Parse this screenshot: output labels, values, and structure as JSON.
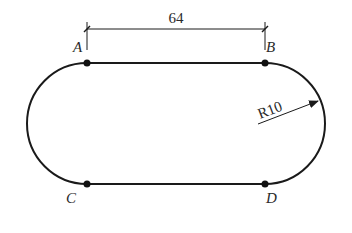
{
  "diagram": {
    "type": "technical-drawing",
    "shape": "stadium (obround) track",
    "stroke_color": "#1a1a1a",
    "background": "#ffffff",
    "dimension": {
      "label": "64",
      "from_point": "A",
      "to_point": "B"
    },
    "radius_annotation": {
      "label": "R10"
    },
    "points": [
      {
        "id": "A",
        "label": "A"
      },
      {
        "id": "B",
        "label": "B"
      },
      {
        "id": "C",
        "label": "C"
      },
      {
        "id": "D",
        "label": "D"
      }
    ]
  }
}
